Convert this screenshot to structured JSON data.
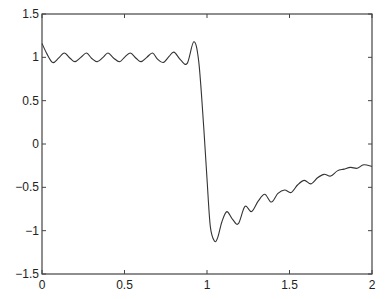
{
  "chart_data": {
    "type": "line",
    "title": "",
    "xlabel": "",
    "ylabel": "",
    "xlim": [
      0,
      2
    ],
    "ylim": [
      -1.5,
      1.5
    ],
    "grid": false,
    "legend": null,
    "x_ticks": [
      0,
      0.5,
      1,
      1.5,
      2
    ],
    "x_tick_labels": [
      "0",
      "0.5",
      "1",
      "1.5",
      "2"
    ],
    "y_ticks": [
      -1.5,
      -1,
      -0.5,
      0,
      0.5,
      1,
      1.5
    ],
    "y_tick_labels": [
      "-1.5",
      "-1",
      "-0.5",
      "0",
      "0.5",
      "1",
      "1.5"
    ],
    "series": [
      {
        "name": "partial Fourier sum",
        "color": "#333333",
        "x": [
          0,
          0.03,
          0.065,
          0.1,
          0.135,
          0.17,
          0.2,
          0.235,
          0.27,
          0.3,
          0.335,
          0.37,
          0.4,
          0.435,
          0.47,
          0.5,
          0.535,
          0.57,
          0.6,
          0.635,
          0.67,
          0.7,
          0.735,
          0.77,
          0.8,
          0.84,
          0.88,
          0.92,
          0.95,
          0.98,
          1.0,
          1.02,
          1.045,
          1.065,
          1.09,
          1.12,
          1.155,
          1.19,
          1.23,
          1.27,
          1.31,
          1.35,
          1.39,
          1.43,
          1.47,
          1.51,
          1.55,
          1.59,
          1.63,
          1.67,
          1.71,
          1.75,
          1.79,
          1.83,
          1.87,
          1.91,
          1.95,
          2.0
        ],
        "y": [
          1.16,
          1.04,
          0.94,
          0.99,
          1.05,
          0.99,
          0.95,
          1.0,
          1.05,
          0.99,
          0.95,
          1.0,
          1.05,
          0.99,
          0.95,
          1.0,
          1.05,
          0.99,
          0.95,
          1.0,
          1.05,
          0.98,
          0.94,
          1.01,
          1.06,
          0.97,
          0.93,
          1.18,
          0.95,
          0.2,
          -0.4,
          -0.95,
          -1.12,
          -1.08,
          -0.9,
          -0.78,
          -0.87,
          -0.92,
          -0.72,
          -0.78,
          -0.66,
          -0.58,
          -0.67,
          -0.57,
          -0.53,
          -0.56,
          -0.47,
          -0.42,
          -0.46,
          -0.39,
          -0.35,
          -0.37,
          -0.31,
          -0.29,
          -0.27,
          -0.28,
          -0.24,
          -0.26
        ]
      }
    ]
  }
}
